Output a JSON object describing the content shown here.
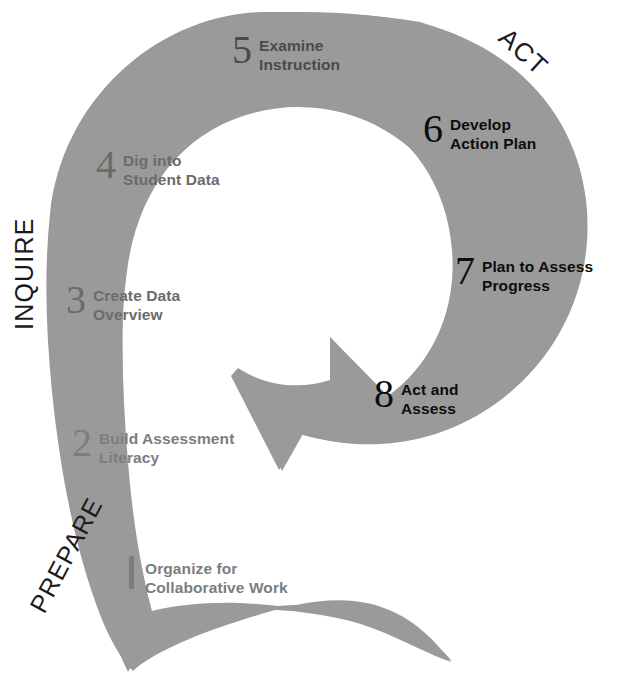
{
  "diagram": {
    "shape_color": "#9a9a9a",
    "background_color": "#ffffff"
  },
  "phases": [
    {
      "id": "prepare",
      "label": "PREPARE",
      "color": "#1a1a1a"
    },
    {
      "id": "inquire",
      "label": "INQUIRE",
      "color": "#1a1a1a"
    },
    {
      "id": "act",
      "label": "ACT",
      "color": "#1a1a1a"
    }
  ],
  "steps": [
    {
      "number": "1",
      "number_style": "bar",
      "line1": "Organize for",
      "line2": "Collaborative Work",
      "phase": "PREPARE",
      "tone": "#7d7d7d"
    },
    {
      "number": "2",
      "number_style": "numeral",
      "line1": "Build Assessment",
      "line2": "Literacy",
      "phase": "PREPARE",
      "tone": "#7d7d7d"
    },
    {
      "number": "3",
      "number_style": "numeral",
      "line1": "Create Data",
      "line2": "Overview",
      "phase": "INQUIRE",
      "tone": "#6b6b6b"
    },
    {
      "number": "4",
      "number_style": "numeral",
      "line1": "Dig into",
      "line2": "Student Data",
      "phase": "INQUIRE",
      "tone": "#6b6b6b"
    },
    {
      "number": "5",
      "number_style": "numeral",
      "line1": "Examine",
      "line2": "Instruction",
      "phase": "INQUIRE",
      "tone": "#4a4a4a"
    },
    {
      "number": "6",
      "number_style": "numeral",
      "line1": "Develop",
      "line2": "Action Plan",
      "phase": "ACT",
      "tone": "#0d0d0d"
    },
    {
      "number": "7",
      "number_style": "numeral",
      "line1": "Plan to Assess",
      "line2": "Progress",
      "phase": "ACT",
      "tone": "#0d0d0d"
    },
    {
      "number": "8",
      "number_style": "numeral",
      "line1": "Act and",
      "line2": "Assess",
      "phase": "ACT",
      "tone": "#0d0d0d"
    }
  ]
}
